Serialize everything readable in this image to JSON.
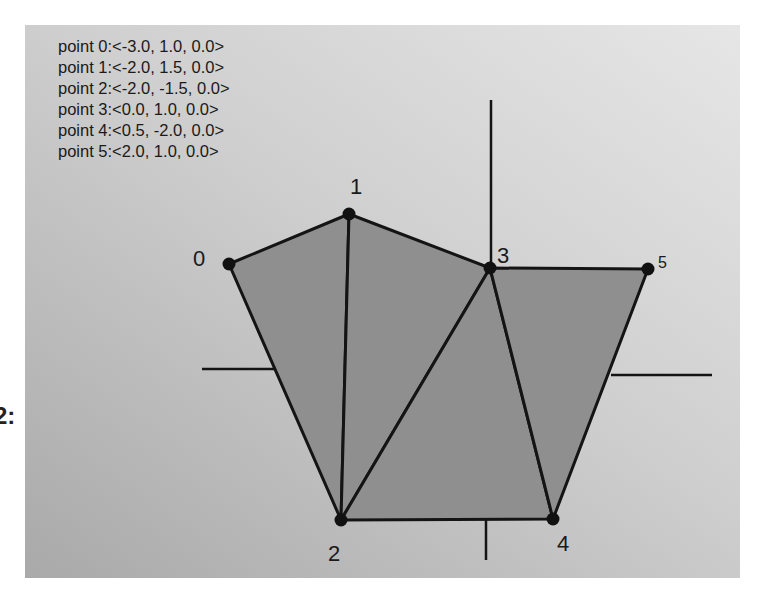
{
  "edge_fragment": "2:",
  "points": [
    {
      "id": 0,
      "label": "0",
      "text": "point 0:<-3.0, 1.0, 0.0>",
      "coords": [
        -3.0,
        1.0,
        0.0
      ],
      "px": [
        229,
        264
      ],
      "label_px": [
        193,
        266
      ],
      "label_size": 22
    },
    {
      "id": 1,
      "label": "1",
      "text": "point 1:<-2.0, 1.5, 0.0>",
      "coords": [
        -2.0,
        1.5,
        0.0
      ],
      "px": [
        349,
        214
      ],
      "label_px": [
        350,
        194
      ],
      "label_size": 22
    },
    {
      "id": 2,
      "label": "2",
      "text": "point 2:<-2.0, -1.5, 0.0>",
      "coords": [
        -2.0,
        -1.5,
        0.0
      ],
      "px": [
        341,
        520
      ],
      "label_px": [
        328,
        561
      ],
      "label_size": 22
    },
    {
      "id": 3,
      "label": "3",
      "text": "point 3:<0.0, 1.0, 0.0>",
      "coords": [
        0.0,
        1.0,
        0.0
      ],
      "px": [
        490,
        268
      ],
      "label_px": [
        497,
        263
      ],
      "label_size": 22
    },
    {
      "id": 4,
      "label": "4",
      "text": "point 4:<0.5, -2.0, 0.0>",
      "coords": [
        0.5,
        -2.0,
        0.0
      ],
      "px": [
        553,
        519
      ],
      "label_px": [
        557,
        551
      ],
      "label_size": 22
    },
    {
      "id": 5,
      "label": "5",
      "text": "point 5:<2.0, 1.0, 0.0>",
      "coords": [
        2.0,
        1.0,
        0.0
      ],
      "px": [
        648,
        269
      ],
      "label_px": [
        658,
        268
      ],
      "label_size": 16
    }
  ],
  "triangles": [
    [
      0,
      1,
      2
    ],
    [
      1,
      3,
      2
    ],
    [
      2,
      3,
      4
    ],
    [
      3,
      5,
      4
    ]
  ],
  "axes": {
    "vertical_top": [
      [
        491,
        100
      ],
      [
        491,
        268
      ]
    ],
    "vertical_bottom": [
      [
        486,
        520
      ],
      [
        486,
        560
      ]
    ],
    "horizontal_left": [
      [
        202,
        369
      ],
      [
        274,
        369
      ]
    ],
    "horizontal_right": [
      [
        611,
        375
      ],
      [
        712,
        375
      ]
    ]
  },
  "colors": {
    "fill": "#8f8f8f",
    "stroke": "#141414",
    "vertex": "#111111"
  }
}
